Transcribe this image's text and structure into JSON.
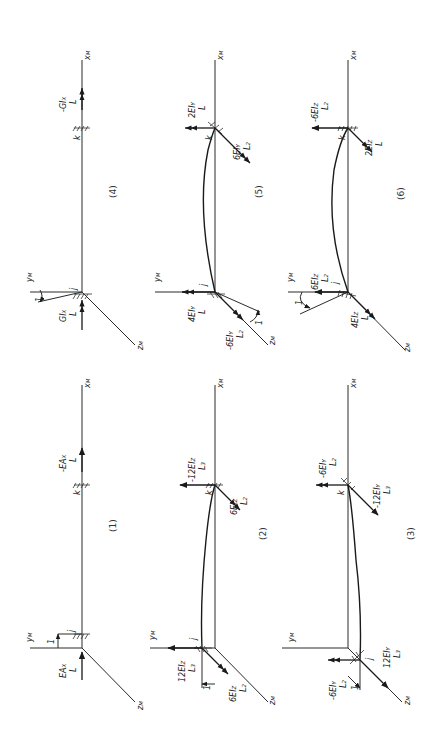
{
  "figure": {
    "orientation": "rotated 90 degrees counter-clockwise",
    "axis_labels": {
      "x": "x_M",
      "y": "y_M",
      "z": "z_M"
    },
    "end_labels": {
      "start": "j",
      "end": "k"
    },
    "panels": [
      {
        "id": "1",
        "caption": "(1)",
        "j_force": "EA_X / L",
        "k_force": "-EA_X / L",
        "displacement": "1"
      },
      {
        "id": "2",
        "caption": "(2)",
        "j_force": "12EI_Z / L^3",
        "j_moment": "6EI_Z / L^2",
        "k_force": "-12EI_Z / L^3",
        "k_moment": "6EI_Z / L^2",
        "displacement": "1"
      },
      {
        "id": "3",
        "caption": "(3)",
        "j_force": "12EI_Y / L^3",
        "j_moment": "-6EI_Y / L^2",
        "k_force": "-12EI_Y / L^3",
        "k_moment": "-6EI_Y / L^2",
        "displacement": "1"
      },
      {
        "id": "4",
        "caption": "(4)",
        "j_force": "GI_X / L",
        "k_force": "-GI_X / L",
        "rotation": "1"
      },
      {
        "id": "5",
        "caption": "(5)",
        "j_force": "4EI_Y / L",
        "j_moment": "-6EI_Y / L^2",
        "k_force": "2EI_Y / L",
        "k_moment": "6EI_Y / L^2",
        "rotation": "1"
      },
      {
        "id": "6",
        "caption": "(6)",
        "j_force": "6EI_Z / L^2",
        "j_moment": "4EI_Z / L",
        "k_force": "-6EI_Z / L^2",
        "k_moment": "2EI_Z / L",
        "rotation": "1"
      }
    ]
  },
  "labels": {
    "xM": "x",
    "yM": "y",
    "zM": "z",
    "M": "M",
    "j": "j",
    "k": "k",
    "one": "1",
    "L": "L",
    "L2": "L",
    "L3": "L",
    "p1": "(1)",
    "p2": "(2)",
    "p3": "(3)",
    "p4": "(4)",
    "p5": "(5)",
    "p6": "(6)",
    "EAx": "EA",
    "GIx": "GI",
    "EIz": "EI",
    "EIy": "EI",
    "X": "X",
    "Y": "Y",
    "Z": "Z",
    "n12": "12",
    "n6": "6",
    "n4": "4",
    "n2": "2",
    "minus": "-"
  }
}
